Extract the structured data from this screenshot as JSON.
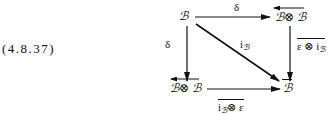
{
  "equation_number": "(4.8.37)",
  "nodes": {
    "top_left": "ℬ",
    "top_right": "ℬ⊗ ℬ",
    "bottom_left": "ℬ⊗ ℬ",
    "bottom_right": "ℬ"
  },
  "arrows": {
    "top": {
      "label": "δ",
      "from": "top_left",
      "to": "top_right"
    },
    "left": {
      "label": "δ",
      "from": "top_left",
      "to": "bottom_left"
    },
    "diagonal": {
      "label_main": "i",
      "label_sub": "ℬ",
      "from": "top_left",
      "to": "bottom_right"
    },
    "right": {
      "label_main": "ε ⊗ i",
      "label_sub": "ℬ",
      "overlined": true,
      "from": "top_right",
      "to": "bottom_right"
    },
    "bottom": {
      "label_main": "i",
      "label_sub": "ℬ",
      "label_tail": "⊗ ε",
      "overlined": true,
      "from": "bottom_left",
      "to": "bottom_right"
    }
  },
  "decorations": {
    "top_right_node": "left-arrow overline (reversed tensor)",
    "bottom_left_node": "left-arrow overline (reversed tensor)",
    "bottom_right_node": "overline"
  }
}
